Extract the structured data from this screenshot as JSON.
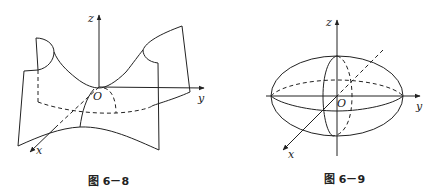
{
  "figures": [
    {
      "id": "fig-6-8",
      "caption": "图 6－8",
      "description": "Hyperbolic paraboloid (saddle surface)",
      "axes": {
        "x": "x",
        "y": "y",
        "z": "z",
        "origin": "O"
      }
    },
    {
      "id": "fig-6-9",
      "caption": "图 6－9",
      "description": "Ellipsoid",
      "axes": {
        "x": "x",
        "y": "y",
        "z": "z",
        "origin": "O"
      }
    }
  ]
}
